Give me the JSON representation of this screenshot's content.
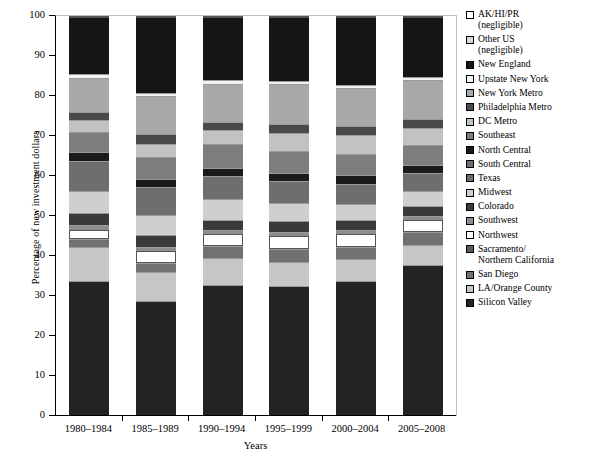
{
  "figure": {
    "title": "",
    "caption": ""
  },
  "axes": {
    "ylabel": "Percentage of new investment dollars",
    "xlabel": "Years",
    "yticks": [
      0,
      10,
      20,
      30,
      40,
      50,
      60,
      70,
      80,
      90,
      100
    ],
    "ylim": [
      0,
      100
    ]
  },
  "chart_data": {
    "type": "bar",
    "stacked": true,
    "stack_mode": "percent",
    "title": "",
    "xlabel": "Years",
    "ylabel": "Percentage of new investment dollars",
    "ylim": [
      0,
      100
    ],
    "grid": false,
    "legend_position": "right",
    "categories": [
      "1980–1984",
      "1985–1989",
      "1990–1994",
      "1995–1999",
      "2000–2004",
      "2005–2008"
    ],
    "series": [
      {
        "name": "Silicon Valley",
        "color": "#232323",
        "values": [
          33.8,
          28.8,
          32.8,
          32.5,
          33.8,
          37.8
        ]
      },
      {
        "name": "LA/Orange County",
        "color": "#c6c6c6",
        "values": [
          8.5,
          7.2,
          6.8,
          6.0,
          5.5,
          5.0
        ]
      },
      {
        "name": "San Diego",
        "color": "#717171",
        "values": [
          2.0,
          2.2,
          2.8,
          3.3,
          3.0,
          3.2
        ]
      },
      {
        "name": "Northwest",
        "color": "#ffffff",
        "values": [
          2.2,
          3.0,
          3.0,
          3.2,
          3.2,
          3.0
        ]
      },
      {
        "name": "Southwest",
        "color": "#8d8d8d",
        "values": [
          1.2,
          1.2,
          1.2,
          1.0,
          1.0,
          1.0
        ]
      },
      {
        "name": "Colorado",
        "color": "#3a3a3a",
        "values": [
          3.0,
          3.0,
          2.5,
          2.8,
          2.5,
          2.5
        ]
      },
      {
        "name": "Midwest",
        "color": "#cfcfcf",
        "values": [
          5.5,
          5.0,
          5.2,
          4.5,
          4.0,
          3.8
        ]
      },
      {
        "name": "Texas",
        "color": "#6e6e6e",
        "values": [
          7.5,
          6.8,
          5.8,
          5.5,
          5.0,
          4.5
        ]
      },
      {
        "name": "North Central",
        "color": "#1a1a1a",
        "values": [
          2.2,
          2.2,
          2.0,
          2.0,
          2.2,
          2.0
        ]
      },
      {
        "name": "Southeast",
        "color": "#7d7d7d",
        "values": [
          5.0,
          5.5,
          5.8,
          5.5,
          5.2,
          5.0
        ]
      },
      {
        "name": "DC Metro",
        "color": "#c2c2c2",
        "values": [
          3.0,
          3.2,
          3.5,
          4.5,
          4.8,
          4.2
        ]
      },
      {
        "name": "Philadelphia Metro",
        "color": "#4a4a4a",
        "values": [
          2.2,
          2.5,
          2.2,
          2.2,
          2.2,
          2.2
        ]
      },
      {
        "name": "New York Metro",
        "color": "#a8a8a8",
        "values": [
          8.5,
          9.5,
          9.5,
          10.0,
          9.5,
          9.8
        ]
      },
      {
        "name": "Upstate New York",
        "color": "#f2f2f2",
        "values": [
          0.8,
          0.8,
          0.8,
          0.8,
          0.8,
          0.8
        ]
      },
      {
        "name": "New England",
        "color": "#151515",
        "values": [
          14.3,
          18.9,
          15.8,
          15.9,
          17.0,
          14.9
        ]
      },
      {
        "name": "Other US (negligible)",
        "color": "#d8d8d8",
        "values": [
          0.2,
          0.2,
          0.2,
          0.2,
          0.2,
          0.2
        ]
      },
      {
        "name": "AK/HI/PR (negligible)",
        "color": "#ffffff",
        "values": [
          0.1,
          0.1,
          0.1,
          0.1,
          0.1,
          0.1
        ]
      }
    ]
  },
  "legend": {
    "items": [
      {
        "label_line1": "AK/HI/PR",
        "label_line2": "(negligible)",
        "color": "#ffffff"
      },
      {
        "label_line1": "Other US",
        "label_line2": "(negligible)",
        "color": "#d8d8d8"
      },
      {
        "label_line1": "New England",
        "label_line2": "",
        "color": "#151515"
      },
      {
        "label_line1": "Upstate New York",
        "label_line2": "",
        "color": "#f2f2f2"
      },
      {
        "label_line1": "New York Metro",
        "label_line2": "",
        "color": "#a8a8a8"
      },
      {
        "label_line1": "Philadelphia Metro",
        "label_line2": "",
        "color": "#4a4a4a"
      },
      {
        "label_line1": "DC Metro",
        "label_line2": "",
        "color": "#c2c2c2"
      },
      {
        "label_line1": "Southeast",
        "label_line2": "",
        "color": "#7d7d7d"
      },
      {
        "label_line1": "North Central",
        "label_line2": "",
        "color": "#1a1a1a"
      },
      {
        "label_line1": "South Central",
        "label_line2": "",
        "color": "#6e6e6e"
      },
      {
        "label_line1": "Texas",
        "label_line2": "",
        "color": "#6e6e6e"
      },
      {
        "label_line1": "Midwest",
        "label_line2": "",
        "color": "#cfcfcf"
      },
      {
        "label_line1": "Colorado",
        "label_line2": "",
        "color": "#3a3a3a"
      },
      {
        "label_line1": "Southwest",
        "label_line2": "",
        "color": "#8d8d8d"
      },
      {
        "label_line1": "Northwest",
        "label_line2": "",
        "color": "#ffffff"
      },
      {
        "label_line1": "Sacramento/",
        "label_line2": "Northern California",
        "color": "#5c5c5c"
      },
      {
        "label_line1": "San Diego",
        "label_line2": "",
        "color": "#717171"
      },
      {
        "label_line1": "LA/Orange County",
        "label_line2": "",
        "color": "#c6c6c6"
      },
      {
        "label_line1": "Silicon Valley",
        "label_line2": "",
        "color": "#232323"
      }
    ]
  }
}
